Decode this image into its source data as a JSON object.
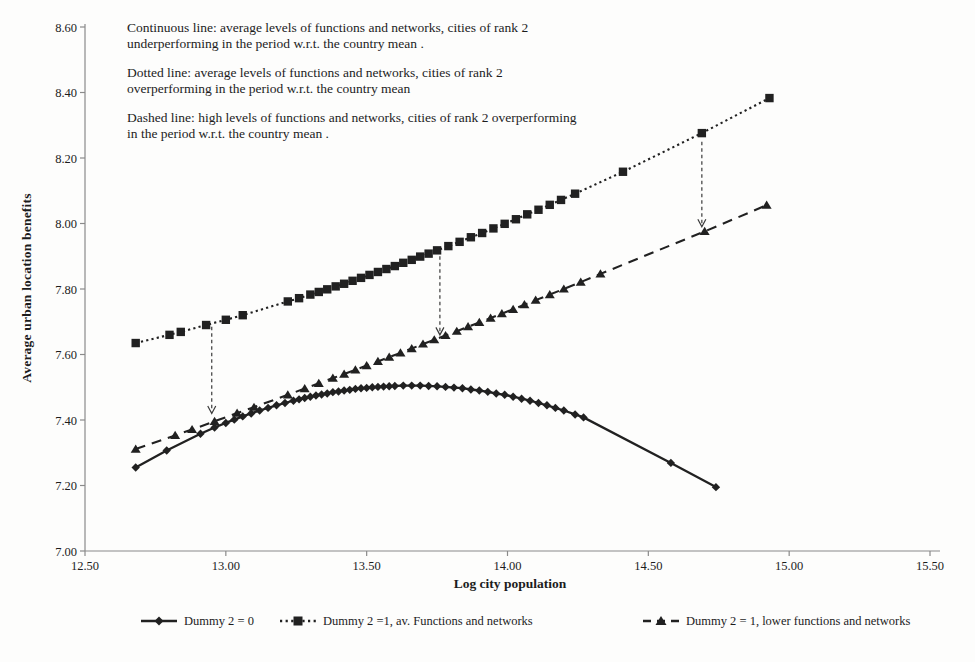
{
  "annotations": [
    {
      "line1": "Continuous line: average levels of functions and networks, cities of rank 2",
      "line2": "underperforming in the period w.r.t. the country mean ."
    },
    {
      "line1": "Dotted line:  average levels of functions and networks, cities of rank 2",
      "line2": "overperforming in the period w.r.t. the country mean"
    },
    {
      "line1": "Dashed line: high levels of functions and networks, cities of rank 2 overperforming",
      "line2": "in the period w.r.t. the country mean ."
    }
  ],
  "chart_data": {
    "type": "line",
    "title": "",
    "xlabel": "Log city population",
    "ylabel": "Average urban location benefits",
    "xlim": [
      12.5,
      15.5
    ],
    "ylim": [
      7.0,
      8.6
    ],
    "grid": false,
    "legend_position": "bottom",
    "axis_color": "#8a8a8a",
    "line_color": "#212121",
    "xtick_values": [
      12.5,
      13.0,
      13.5,
      14.0,
      14.5,
      15.0,
      15.5
    ],
    "xtick_labels": [
      "12.50",
      "13.00",
      "13.50",
      "14.00",
      "14.50",
      "15.00",
      "15.50"
    ],
    "ytick_values": [
      7.0,
      7.2,
      7.4,
      7.6,
      7.8,
      8.0,
      8.2,
      8.4,
      8.6
    ],
    "ytick_labels": [
      "7.00",
      "7.20",
      "7.40",
      "7.60",
      "7.80",
      "8.00",
      "8.20",
      "8.40",
      "8.60"
    ],
    "series": [
      {
        "name": "Dummy 2 = 0",
        "line_style": "solid",
        "marker": "diamond",
        "color": "#212121",
        "points": [
          [
            12.68,
            7.255
          ],
          [
            12.79,
            7.307
          ],
          [
            12.91,
            7.358
          ],
          [
            12.96,
            7.377
          ],
          [
            13.0,
            7.391
          ],
          [
            13.03,
            7.401
          ],
          [
            13.06,
            7.411
          ],
          [
            13.09,
            7.42
          ],
          [
            13.12,
            7.429
          ],
          [
            13.15,
            7.437
          ],
          [
            13.18,
            7.445
          ],
          [
            13.21,
            7.452
          ],
          [
            13.24,
            7.459
          ],
          [
            13.26,
            7.463
          ],
          [
            13.28,
            7.467
          ],
          [
            13.3,
            7.471
          ],
          [
            13.32,
            7.475
          ],
          [
            13.34,
            7.478
          ],
          [
            13.36,
            7.481
          ],
          [
            13.38,
            7.485
          ],
          [
            13.4,
            7.487
          ],
          [
            13.42,
            7.49
          ],
          [
            13.44,
            7.492
          ],
          [
            13.46,
            7.495
          ],
          [
            13.48,
            7.497
          ],
          [
            13.5,
            7.498
          ],
          [
            13.52,
            7.5
          ],
          [
            13.54,
            7.501
          ],
          [
            13.56,
            7.502
          ],
          [
            13.58,
            7.503
          ],
          [
            13.6,
            7.504
          ],
          [
            13.63,
            7.505
          ],
          [
            13.66,
            7.505
          ],
          [
            13.69,
            7.505
          ],
          [
            13.72,
            7.504
          ],
          [
            13.75,
            7.503
          ],
          [
            13.78,
            7.501
          ],
          [
            13.81,
            7.499
          ],
          [
            13.84,
            7.497
          ],
          [
            13.87,
            7.493
          ],
          [
            13.9,
            7.49
          ],
          [
            13.93,
            7.486
          ],
          [
            13.96,
            7.481
          ],
          [
            13.99,
            7.477
          ],
          [
            14.02,
            7.471
          ],
          [
            14.05,
            7.465
          ],
          [
            14.08,
            7.459
          ],
          [
            14.11,
            7.452
          ],
          [
            14.14,
            7.445
          ],
          [
            14.17,
            7.437
          ],
          [
            14.2,
            7.429
          ],
          [
            14.24,
            7.417
          ],
          [
            14.27,
            7.408
          ],
          [
            14.58,
            7.269
          ],
          [
            14.74,
            7.195
          ]
        ]
      },
      {
        "name": "Dummy 2 =1, av. Functions and networks",
        "line_style": "dotted",
        "marker": "square",
        "color": "#212121",
        "points": [
          [
            12.68,
            7.635
          ],
          [
            12.8,
            7.66
          ],
          [
            12.84,
            7.669
          ],
          [
            12.93,
            7.69
          ],
          [
            13.0,
            7.706
          ],
          [
            13.06,
            7.72
          ],
          [
            13.22,
            7.762
          ],
          [
            13.26,
            7.772
          ],
          [
            13.3,
            7.783
          ],
          [
            13.33,
            7.791
          ],
          [
            13.36,
            7.799
          ],
          [
            13.39,
            7.808
          ],
          [
            13.42,
            7.816
          ],
          [
            13.45,
            7.825
          ],
          [
            13.48,
            7.834
          ],
          [
            13.51,
            7.843
          ],
          [
            13.54,
            7.852
          ],
          [
            13.57,
            7.861
          ],
          [
            13.6,
            7.87
          ],
          [
            13.63,
            7.88
          ],
          [
            13.66,
            7.889
          ],
          [
            13.69,
            7.899
          ],
          [
            13.72,
            7.908
          ],
          [
            13.75,
            7.918
          ],
          [
            13.79,
            7.931
          ],
          [
            13.83,
            7.944
          ],
          [
            13.87,
            7.958
          ],
          [
            13.91,
            7.971
          ],
          [
            13.95,
            7.985
          ],
          [
            13.99,
            7.999
          ],
          [
            14.03,
            8.013
          ],
          [
            14.07,
            8.028
          ],
          [
            14.11,
            8.042
          ],
          [
            14.15,
            8.057
          ],
          [
            14.19,
            8.072
          ],
          [
            14.24,
            8.091
          ],
          [
            14.41,
            8.158
          ],
          [
            14.69,
            8.276
          ],
          [
            14.93,
            8.383
          ]
        ]
      },
      {
        "name": "Dummy 2 = 1, lower functions and networks",
        "line_style": "dashed",
        "marker": "triangle",
        "color": "#212121",
        "points": [
          [
            12.68,
            7.311
          ],
          [
            12.82,
            7.353
          ],
          [
            12.88,
            7.371
          ],
          [
            12.96,
            7.396
          ],
          [
            13.04,
            7.421
          ],
          [
            13.1,
            7.439
          ],
          [
            13.22,
            7.477
          ],
          [
            13.28,
            7.496
          ],
          [
            13.33,
            7.512
          ],
          [
            13.38,
            7.528
          ],
          [
            13.42,
            7.54
          ],
          [
            13.46,
            7.553
          ],
          [
            13.5,
            7.566
          ],
          [
            13.54,
            7.579
          ],
          [
            13.58,
            7.592
          ],
          [
            13.62,
            7.605
          ],
          [
            13.66,
            7.618
          ],
          [
            13.7,
            7.632
          ],
          [
            13.74,
            7.645
          ],
          [
            13.78,
            7.658
          ],
          [
            13.82,
            7.671
          ],
          [
            13.86,
            7.685
          ],
          [
            13.9,
            7.698
          ],
          [
            13.94,
            7.711
          ],
          [
            13.98,
            7.725
          ],
          [
            14.02,
            7.738
          ],
          [
            14.06,
            7.752
          ],
          [
            14.1,
            7.766
          ],
          [
            14.15,
            7.783
          ],
          [
            14.2,
            7.8
          ],
          [
            14.26,
            7.821
          ],
          [
            14.33,
            7.846
          ],
          [
            14.7,
            7.976
          ],
          [
            14.92,
            8.056
          ]
        ]
      }
    ],
    "arrows": [
      {
        "x": 12.95,
        "from": 7.685,
        "to": 7.42
      },
      {
        "x": 13.76,
        "from": 7.9,
        "to": 7.66
      },
      {
        "x": 14.69,
        "from": 8.25,
        "to": 7.99
      }
    ]
  }
}
